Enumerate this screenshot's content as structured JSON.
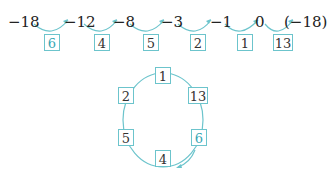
{
  "sequence": {
    "values": [
      "−18",
      "−12",
      "−8",
      "−3",
      "−1",
      "0",
      "(−18)"
    ],
    "steps": [
      "6",
      "4",
      "5",
      "2",
      "1",
      "13"
    ]
  },
  "cycle": {
    "top": "1",
    "upper_left": "2",
    "upper_right": "13",
    "lower_left": "5",
    "lower_right": "6",
    "bottom": "4"
  },
  "colors": {
    "accent": "#35a6b4",
    "box_border": "#6cc4cc",
    "text": "#222222"
  }
}
